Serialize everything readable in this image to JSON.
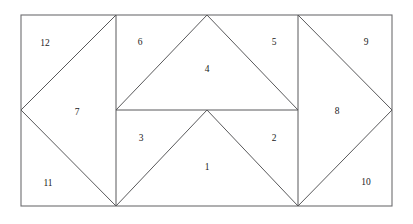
{
  "figure": {
    "canvas": {
      "width": 413,
      "height": 224
    },
    "background_color": "#ffffff",
    "line_color": "#59595b",
    "border_color": "#6d6d70",
    "label_color": "#1a1a1a",
    "outer_rectangle": {
      "x1": 21,
      "y1": 15,
      "x2": 392,
      "y2": 206
    },
    "vertices": {
      "top_left": {
        "x": 21,
        "y": 15
      },
      "top_v1": {
        "x": 116,
        "y": 15
      },
      "top_apex": {
        "x": 207,
        "y": 15
      },
      "top_v2": {
        "x": 298,
        "y": 15
      },
      "top_right": {
        "x": 392,
        "y": 15
      },
      "mid_left": {
        "x": 21,
        "y": 110
      },
      "mid_v1": {
        "x": 116,
        "y": 110
      },
      "mid_center": {
        "x": 207,
        "y": 110
      },
      "mid_v2": {
        "x": 298,
        "y": 110
      },
      "mid_right": {
        "x": 392,
        "y": 110
      },
      "bottom_left": {
        "x": 21,
        "y": 206
      },
      "bottom_v1": {
        "x": 116,
        "y": 206
      },
      "bottom_v2": {
        "x": 298,
        "y": 206
      },
      "bottom_right": {
        "x": 392,
        "y": 206
      }
    },
    "segments": [
      {
        "name": "vertical-divider-left",
        "x1": 116,
        "y1": 15,
        "x2": 116,
        "y2": 206
      },
      {
        "name": "vertical-divider-right",
        "x1": 298,
        "y1": 15,
        "x2": 298,
        "y2": 206
      },
      {
        "name": "horizontal-midline",
        "x1": 116,
        "y1": 110,
        "x2": 298,
        "y2": 110
      },
      {
        "name": "diag-left-diamond-upper",
        "x1": 21,
        "y1": 110,
        "x2": 116,
        "y2": 15
      },
      {
        "name": "diag-left-diamond-lower",
        "x1": 21,
        "y1": 110,
        "x2": 116,
        "y2": 206
      },
      {
        "name": "diag-center-upper-left",
        "x1": 116,
        "y1": 110,
        "x2": 207,
        "y2": 15
      },
      {
        "name": "diag-center-upper-right",
        "x1": 207,
        "y1": 15,
        "x2": 298,
        "y2": 110
      },
      {
        "name": "diag-center-lower-left",
        "x1": 116,
        "y1": 206,
        "x2": 207,
        "y2": 110
      },
      {
        "name": "diag-center-lower-right",
        "x1": 207,
        "y1": 110,
        "x2": 298,
        "y2": 206
      },
      {
        "name": "diag-right-diamond-upper",
        "x1": 298,
        "y1": 15,
        "x2": 392,
        "y2": 110
      },
      {
        "name": "diag-right-diamond-lower",
        "x1": 298,
        "y1": 206,
        "x2": 392,
        "y2": 110
      }
    ],
    "labels": [
      {
        "id": "region-1",
        "text": "1",
        "x": 207,
        "y": 168
      },
      {
        "id": "region-2",
        "text": "2",
        "x": 274,
        "y": 139
      },
      {
        "id": "region-3",
        "text": "3",
        "x": 141,
        "y": 139
      },
      {
        "id": "region-4",
        "text": "4",
        "x": 207,
        "y": 70
      },
      {
        "id": "region-5",
        "text": "5",
        "x": 274,
        "y": 43
      },
      {
        "id": "region-6",
        "text": "6",
        "x": 140,
        "y": 43
      },
      {
        "id": "region-7",
        "text": "7",
        "x": 77,
        "y": 113
      },
      {
        "id": "region-8",
        "text": "8",
        "x": 337,
        "y": 112
      },
      {
        "id": "region-9",
        "text": "9",
        "x": 366,
        "y": 43
      },
      {
        "id": "region-10",
        "text": "10",
        "x": 366,
        "y": 183
      },
      {
        "id": "region-11",
        "text": "11",
        "x": 48,
        "y": 184
      },
      {
        "id": "region-12",
        "text": "12",
        "x": 45,
        "y": 44
      }
    ]
  }
}
